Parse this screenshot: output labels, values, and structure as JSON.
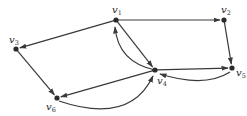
{
  "diagram": {
    "type": "directed-graph",
    "nodes": [
      {
        "id": "v1",
        "label": "v",
        "sub": "1"
      },
      {
        "id": "v2",
        "label": "v",
        "sub": "2"
      },
      {
        "id": "v3",
        "label": "v",
        "sub": "3"
      },
      {
        "id": "v4",
        "label": "v",
        "sub": "4"
      },
      {
        "id": "v5",
        "label": "v",
        "sub": "5"
      },
      {
        "id": "v6",
        "label": "v",
        "sub": "6"
      }
    ],
    "edges": [
      {
        "from": "v1",
        "to": "v2",
        "style": "straight"
      },
      {
        "from": "v1",
        "to": "v3",
        "style": "straight"
      },
      {
        "from": "v1",
        "to": "v4",
        "style": "straight"
      },
      {
        "from": "v4",
        "to": "v1",
        "style": "curved"
      },
      {
        "from": "v2",
        "to": "v5",
        "style": "straight"
      },
      {
        "from": "v3",
        "to": "v6",
        "style": "straight"
      },
      {
        "from": "v4",
        "to": "v5",
        "style": "straight"
      },
      {
        "from": "v5",
        "to": "v4",
        "style": "curved"
      },
      {
        "from": "v4",
        "to": "v6",
        "style": "straight"
      },
      {
        "from": "v6",
        "to": "v4",
        "style": "curved"
      }
    ],
    "colors": {
      "ink": "#2a2a2a"
    }
  }
}
